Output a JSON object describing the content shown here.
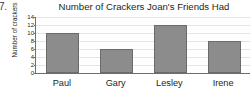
{
  "item_number": "7.",
  "chart_data": {
    "type": "bar",
    "title": "Number of Crackers Joan's Friends Had",
    "xlabel": "",
    "ylabel": "Number of crackers",
    "categories": [
      "Paul",
      "Gary",
      "Lesley",
      "Irene"
    ],
    "values": [
      10,
      6,
      12,
      8
    ],
    "ylim": [
      0,
      14
    ],
    "yticks": [
      0,
      2,
      4,
      6,
      8,
      10,
      12,
      14
    ],
    "ytick_labels": [
      "0",
      "2",
      "4",
      "6",
      "8",
      "10",
      "12",
      "14"
    ],
    "grid": true,
    "legend": null,
    "colors": {
      "bar_fill": "#8c8c8c",
      "bar_edge": "#6b6b6b",
      "gridline": "#e3e3e3",
      "axis": "#6d6e71",
      "text": "#231f20",
      "background": "#ffffff"
    }
  }
}
